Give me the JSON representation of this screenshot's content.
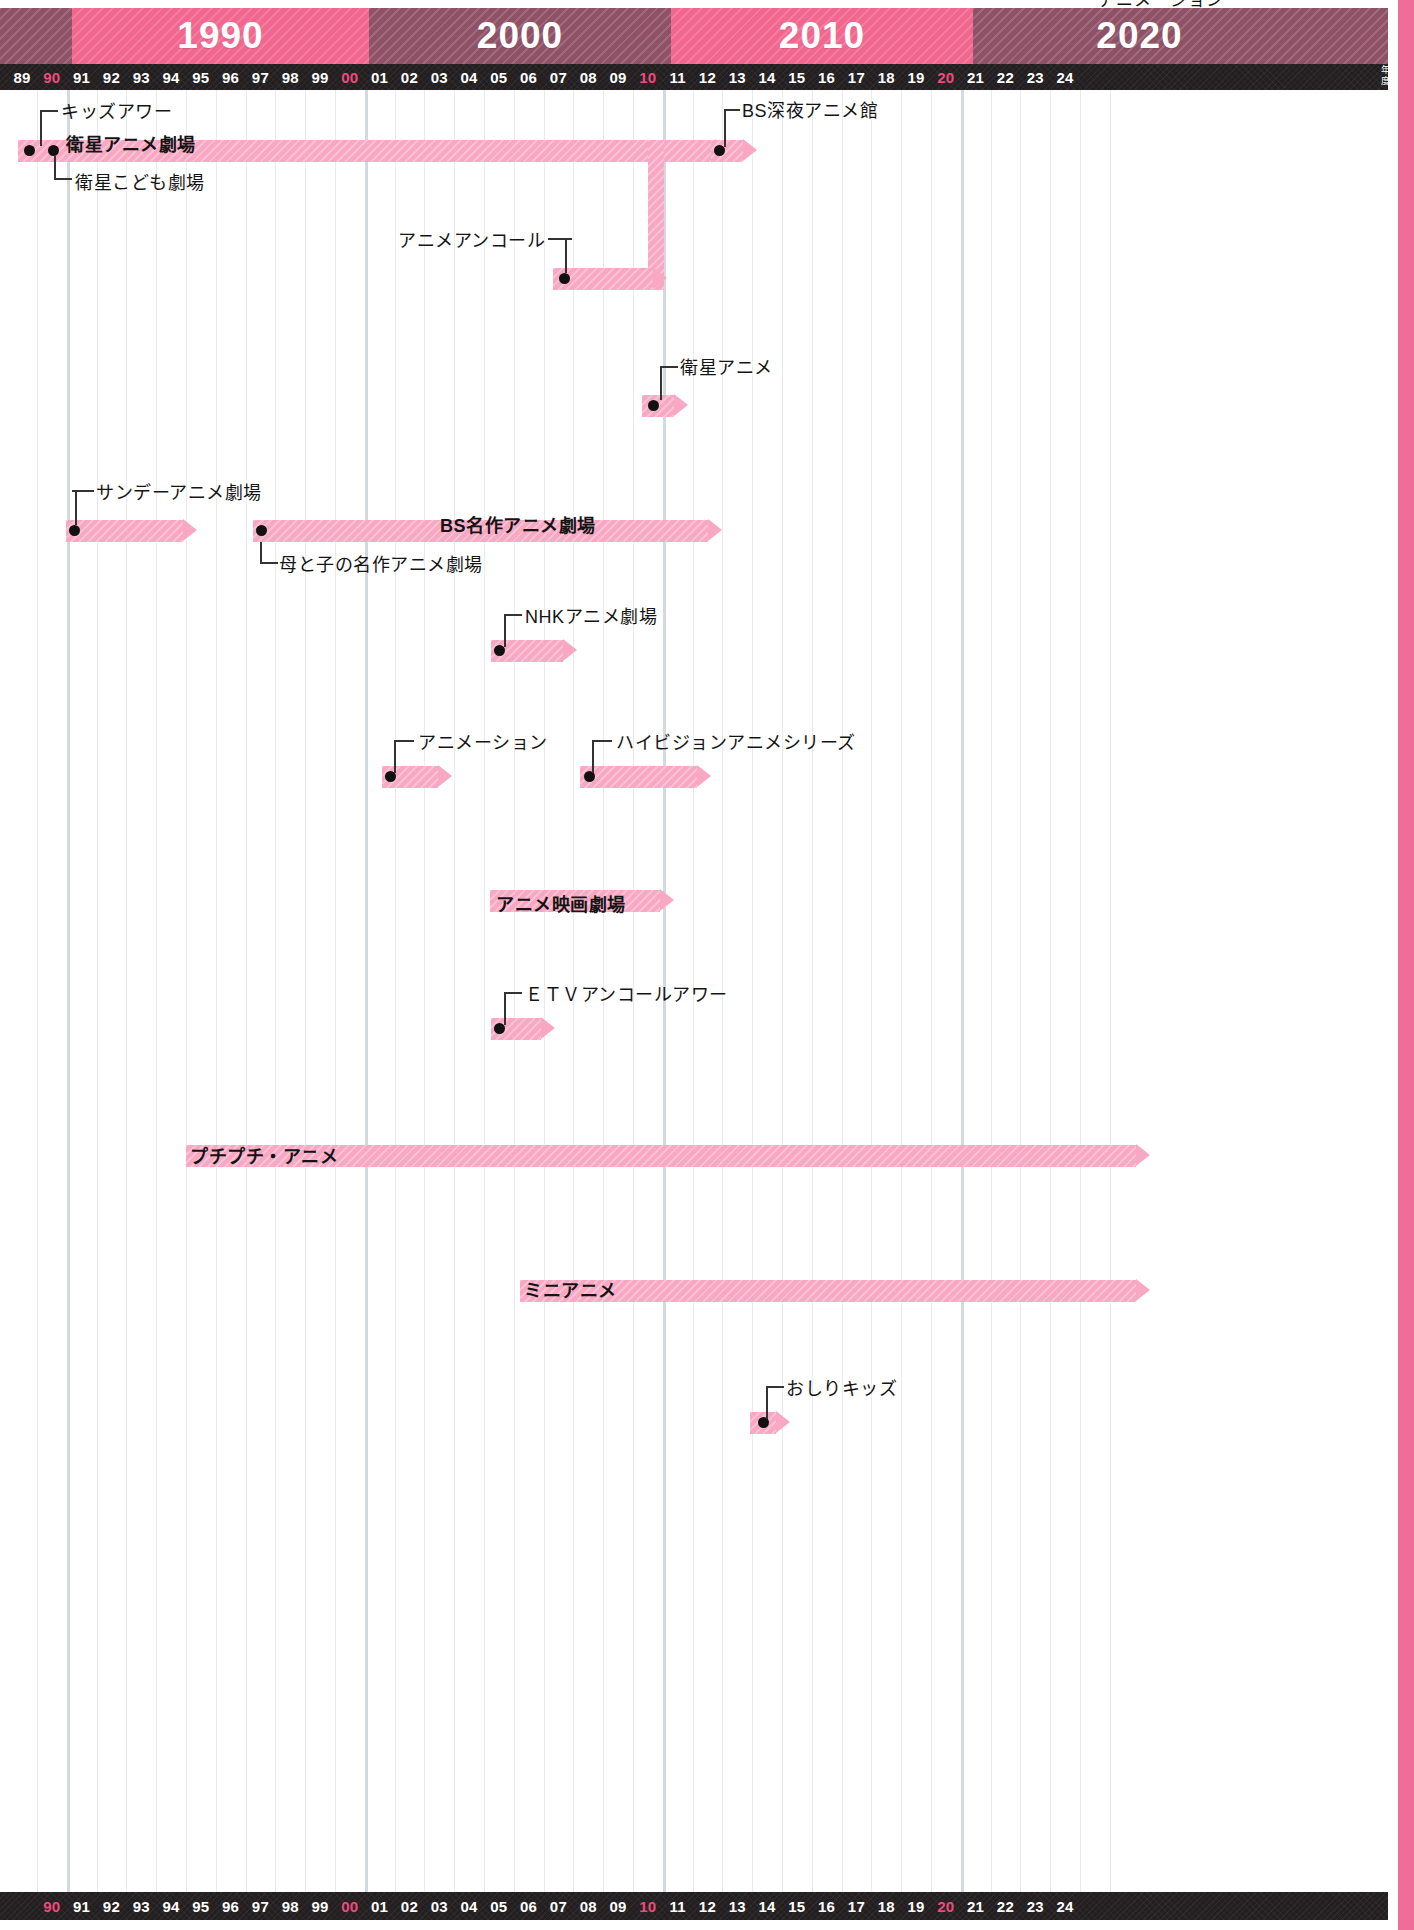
{
  "page": {
    "top_caption": "アニメーション",
    "axis_unit": "年度",
    "background": "#ffffff",
    "accent_pink": "#f2678f",
    "bar_pink": "#f9a8c3",
    "dark_band": "#8e5166",
    "tick_bar_color": "#231f20",
    "accent_tick_color": "#ef4a7e"
  },
  "decades": [
    {
      "label": "",
      "start_year": 89,
      "end_year": 90,
      "style": "dark"
    },
    {
      "label": "1990",
      "start_year": 90,
      "end_year": 100,
      "style": "pink"
    },
    {
      "label": "2000",
      "start_year": 100,
      "end_year": 110,
      "style": "dark"
    },
    {
      "label": "2010",
      "start_year": 110,
      "end_year": 120,
      "style": "pink"
    },
    {
      "label": "2020",
      "start_year": 120,
      "end_year": 125,
      "style": "dark"
    }
  ],
  "axis_top": {
    "ticks": [
      "89",
      "90",
      "91",
      "92",
      "93",
      "94",
      "95",
      "96",
      "97",
      "98",
      "99",
      "00",
      "01",
      "02",
      "03",
      "04",
      "05",
      "06",
      "07",
      "08",
      "09",
      "10",
      "11",
      "12",
      "13",
      "14",
      "15",
      "16",
      "17",
      "18",
      "19",
      "20",
      "21",
      "22",
      "23",
      "24"
    ],
    "accent_ticks": [
      "90",
      "00",
      "10",
      "20"
    ],
    "unit_label_line1": "年",
    "unit_label_line2": "度"
  },
  "axis_bottom": {
    "ticks": [
      "90",
      "91",
      "92",
      "93",
      "94",
      "95",
      "96",
      "97",
      "98",
      "99",
      "00",
      "01",
      "02",
      "03",
      "04",
      "05",
      "06",
      "07",
      "08",
      "09",
      "10",
      "11",
      "12",
      "13",
      "14",
      "15",
      "16",
      "17",
      "18",
      "19",
      "20",
      "21",
      "22",
      "23",
      "24"
    ],
    "accent_ticks": [
      "90",
      "00",
      "10",
      "20"
    ]
  },
  "chart_data": {
    "type": "bar",
    "title": "アニメーション",
    "xlabel": "年度",
    "ylabel": "",
    "xlim": [
      89,
      125
    ],
    "grid": true,
    "legend": "none",
    "orientation": "horizontal-timeline",
    "categories": [
      "キッズアワー",
      "衛星アニメ劇場",
      "衛星こども劇場",
      "BS深夜アニメ館",
      "アニメアンコール",
      "衛星アニメ",
      "サンデーアニメ劇場",
      "BS名作アニメ劇場",
      "母と子の名作アニメ劇場",
      "NHKアニメ劇場",
      "アニメーション",
      "ハイビジョンアニメシリーズ",
      "アニメ映画劇場",
      "ETVアンコールアワー",
      "プチプチ・アニメ",
      "ミニアニメ",
      "おしりキッズ"
    ],
    "series": [
      {
        "name": "放送期間",
        "items": [
          {
            "label": "キッズアワー",
            "start": 89,
            "end": 90.3,
            "row": 0,
            "label_mode": "leader",
            "ongoing": false
          },
          {
            "label": "衛星アニメ劇場",
            "start": 89,
            "end": 110.6,
            "row": 0,
            "label_mode": "inbar",
            "ongoing": true
          },
          {
            "label": "衛星こども劇場",
            "start": 89.8,
            "end": 90.3,
            "row": 0,
            "label_mode": "leader",
            "ongoing": false
          },
          {
            "label": "BS深夜アニメ館",
            "start": 111,
            "end": 111.8,
            "row": 0,
            "label_mode": "leader",
            "ongoing": false
          },
          {
            "label": "アニメアンコール",
            "start": 105.9,
            "end": 109.8,
            "row": 2,
            "label_mode": "leader",
            "ongoing": false
          },
          {
            "label": "衛星アニメ",
            "start": 108.9,
            "end": 110.0,
            "row": 4,
            "label_mode": "leader",
            "ongoing": false
          },
          {
            "label": "サンデーアニメ劇場",
            "start": 89.4,
            "end": 93.1,
            "row": 6,
            "label_mode": "leader",
            "ongoing": true
          },
          {
            "label": "BS名作アニメ劇場",
            "start": 95.5,
            "end": 111.0,
            "row": 6,
            "label_mode": "inbar",
            "ongoing": true
          },
          {
            "label": "母と子の名作アニメ劇場",
            "start": 95.5,
            "end": 96.2,
            "row": 6,
            "label_mode": "leader",
            "ongoing": false
          },
          {
            "label": "NHKアニメ劇場",
            "start": 104.0,
            "end": 106.3,
            "row": 8,
            "label_mode": "leader",
            "ongoing": true
          },
          {
            "label": "アニメーション",
            "start": 100.7,
            "end": 102.5,
            "row": 10,
            "label_mode": "leader",
            "ongoing": true
          },
          {
            "label": "ハイビジョンアニメシリーズ",
            "start": 106.8,
            "end": 110.9,
            "row": 10,
            "label_mode": "leader",
            "ongoing": true
          },
          {
            "label": "アニメ映画劇場",
            "start": 103.5,
            "end": 110.0,
            "row": 12,
            "label_mode": "inbar",
            "ongoing": true
          },
          {
            "label": "ETVアンコールアワー",
            "start": 104.0,
            "end": 105.9,
            "row": 14,
            "label_mode": "leader",
            "ongoing": true
          },
          {
            "label": "プチプチ・アニメ",
            "start": 93.5,
            "end": 124.6,
            "row": 16,
            "label_mode": "inbar",
            "ongoing": true
          },
          {
            "label": "ミニアニメ",
            "start": 104.5,
            "end": 124.6,
            "row": 18,
            "label_mode": "inbar",
            "ongoing": true
          },
          {
            "label": "おしりキッズ",
            "start": 112.6,
            "end": 113.4,
            "row": 20,
            "label_mode": "leader",
            "ongoing": true
          }
        ]
      }
    ]
  },
  "bars": [
    {
      "id": "eisei-anime-gekijo",
      "name": "衛星アニメ劇場",
      "x": 18,
      "y": 50,
      "w": 697,
      "h": 22,
      "label": "衛星アニメ劇場",
      "label_x": 66,
      "label_y": 40,
      "label_mode": "inbar",
      "arrow": true
    },
    {
      "id": "bs-shinya-anime-kan",
      "name": "BS深夜アニメ館",
      "x": 711,
      "y": 50,
      "w": 32,
      "h": 22,
      "label": "BS深夜アニメ館",
      "label_x": 742,
      "label_y": 6,
      "label_mode": "leader",
      "arrow": true
    },
    {
      "id": "anime-encore",
      "name": "アニメアンコール",
      "x": 553,
      "y": 178,
      "w": 100,
      "h": 22,
      "label": "アニメアンコール",
      "label_x": 398,
      "label_y": 136,
      "label_mode": "leader",
      "arrow": true
    },
    {
      "id": "eisei-anime",
      "name": "衛星アニメ",
      "x": 642,
      "y": 305,
      "w": 32,
      "h": 22,
      "label": "衛星アニメ",
      "label_x": 680,
      "label_y": 263,
      "label_mode": "leader",
      "arrow": true
    },
    {
      "id": "sunday-anime-gekijo",
      "name": "サンデーアニメ劇場",
      "x": 66,
      "y": 430,
      "w": 117,
      "h": 22,
      "label": "サンデーアニメ劇場",
      "label_x": 96,
      "label_y": 388,
      "label_mode": "leader",
      "arrow": true
    },
    {
      "id": "bs-meisaku-anime-gekijo",
      "name": "BS名作アニメ劇場",
      "x": 253,
      "y": 430,
      "w": 455,
      "h": 22,
      "label": "BS名作アニメ劇場",
      "label_x": 440,
      "label_y": 421,
      "label_mode": "inbar",
      "arrow": true
    },
    {
      "id": "hahatoko-meisaku-anime-gekijo",
      "name": "母と子の名作アニメ劇場",
      "x": 253,
      "y": 430,
      "w": 24,
      "h": 22,
      "label": "母と子の名作アニメ劇場",
      "label_x": 279,
      "label_y": 460,
      "label_mode": "leader",
      "arrow": false
    },
    {
      "id": "nhk-anime-gekijo",
      "name": "NHKアニメ劇場",
      "x": 491,
      "y": 550,
      "w": 72,
      "h": 22,
      "label": "NHKアニメ劇場",
      "label_x": 525,
      "label_y": 512,
      "label_mode": "leader",
      "arrow": true
    },
    {
      "id": "animation",
      "name": "アニメーション",
      "x": 382,
      "y": 676,
      "w": 56,
      "h": 22,
      "label": "アニメーション",
      "label_x": 418,
      "label_y": 638,
      "label_mode": "leader",
      "arrow": true
    },
    {
      "id": "hivision-anime-series",
      "name": "ハイビジョンアニメシリーズ",
      "x": 580,
      "y": 676,
      "w": 117,
      "h": 22,
      "label": "ハイビジョンアニメシリーズ",
      "label_x": 616,
      "label_y": 638,
      "label_mode": "leader",
      "arrow": true
    },
    {
      "id": "anime-eiga-gekijo",
      "name": "アニメ映画劇場",
      "x": 490,
      "y": 800,
      "w": 170,
      "h": 22,
      "label": "アニメ映画劇場",
      "label_x": 496,
      "label_y": 800,
      "label_mode": "inbar",
      "arrow": true
    },
    {
      "id": "etv-encore-hour",
      "name": "ETVアンコールアワー",
      "x": 491,
      "y": 928,
      "w": 50,
      "h": 22,
      "label": "ＥＴＶアンコールアワー",
      "label_x": 525,
      "label_y": 890,
      "label_mode": "leader",
      "arrow": true
    },
    {
      "id": "puchi-puchi-anime",
      "name": "プチプチ・アニメ",
      "x": 186,
      "y": 1055,
      "w": 950,
      "h": 22,
      "label": "プチプチ・アニメ",
      "label_x": 190,
      "label_y": 1052,
      "label_mode": "inbar",
      "arrow": true
    },
    {
      "id": "mini-anime",
      "name": "ミニアニメ",
      "x": 520,
      "y": 1190,
      "w": 616,
      "h": 22,
      "label": "ミニアニメ",
      "label_x": 524,
      "label_y": 1186,
      "label_mode": "inbar",
      "arrow": true
    },
    {
      "id": "oshiri-kids",
      "name": "おしりキッズ",
      "x": 750,
      "y": 1322,
      "w": 26,
      "h": 22,
      "label": "おしりキッズ",
      "label_x": 786,
      "label_y": 1284,
      "label_mode": "leader",
      "arrow": true
    },
    {
      "id": "kids-hour",
      "name": "キッズアワー",
      "x": 18,
      "y": 50,
      "w": 30,
      "h": 22,
      "label": "キッズアワー",
      "label_x": 61,
      "label_y": 7,
      "label_mode": "leader",
      "arrow": false
    },
    {
      "id": "eisei-kodomo-gekijo",
      "name": "衛星こども劇場",
      "x": 18,
      "y": 50,
      "w": 30,
      "h": 22,
      "label": "衛星こども劇場",
      "label_x": 75,
      "label_y": 78,
      "label_mode": "leader",
      "arrow": false
    }
  ]
}
